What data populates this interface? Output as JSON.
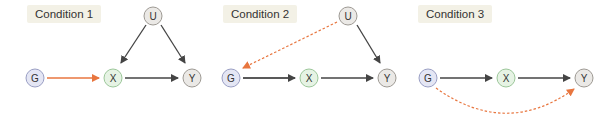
{
  "colors": {
    "g_fill": "#e4e6f4",
    "g_stroke": "#9a9fc4",
    "x_fill": "#e6f3e4",
    "x_stroke": "#9cc79a",
    "y_fill": "#ebe9e6",
    "y_stroke": "#9e9a94",
    "u_fill": "#ebe9e6",
    "u_stroke": "#9e9a94",
    "edge": "#444444",
    "highlight": "#e8763f"
  },
  "panels": [
    {
      "label": "Condition 1",
      "nodes": [
        {
          "id": "U",
          "text": "U"
        },
        {
          "id": "G",
          "text": "G"
        },
        {
          "id": "X",
          "text": "X"
        },
        {
          "id": "Y",
          "text": "Y"
        }
      ],
      "edges": [
        {
          "from": "U",
          "to": "X",
          "style": "solid"
        },
        {
          "from": "U",
          "to": "Y",
          "style": "solid"
        },
        {
          "from": "G",
          "to": "X",
          "style": "solid-orange"
        },
        {
          "from": "X",
          "to": "Y",
          "style": "solid"
        }
      ]
    },
    {
      "label": "Condition 2",
      "nodes": [
        {
          "id": "U",
          "text": "U"
        },
        {
          "id": "G",
          "text": "G"
        },
        {
          "id": "X",
          "text": "X"
        },
        {
          "id": "Y",
          "text": "Y"
        }
      ],
      "edges": [
        {
          "from": "U",
          "to": "G",
          "style": "dashed-orange"
        },
        {
          "from": "U",
          "to": "Y",
          "style": "solid"
        },
        {
          "from": "G",
          "to": "X",
          "style": "solid"
        },
        {
          "from": "X",
          "to": "Y",
          "style": "solid"
        }
      ]
    },
    {
      "label": "Condition 3",
      "nodes": [
        {
          "id": "G",
          "text": "G"
        },
        {
          "id": "X",
          "text": "X"
        },
        {
          "id": "Y",
          "text": "Y"
        }
      ],
      "edges": [
        {
          "from": "G",
          "to": "X",
          "style": "solid"
        },
        {
          "from": "X",
          "to": "Y",
          "style": "solid"
        },
        {
          "from": "G",
          "to": "Y",
          "style": "dashed-orange-curved"
        }
      ]
    }
  ]
}
